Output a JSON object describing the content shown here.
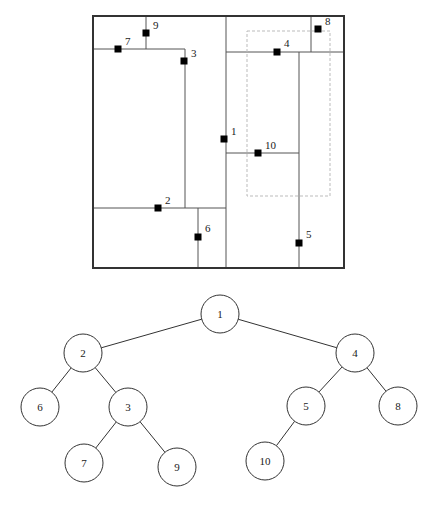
{
  "figure": {
    "type": "kd-tree-partition-with-binary-tree",
    "background_color": "#ffffff",
    "line_color": "#555555",
    "border_color": "#333333",
    "point_color": "#000000",
    "text_color": "#1a1a1a",
    "dashed_color": "#bbbbbb"
  },
  "partition_panel": {
    "name": "kd-tree-space-partition",
    "border": {
      "x": 93,
      "y": 16,
      "width": 251,
      "height": 252
    },
    "query_rectangle": {
      "x": 247,
      "y": 31,
      "width": 83,
      "height": 165,
      "style": "dashed"
    },
    "split_lines": [
      {
        "id": "split-1",
        "orientation": "vertical",
        "x": 226,
        "y1": 16,
        "y2": 268
      },
      {
        "id": "split-2",
        "orientation": "horizontal",
        "y": 208,
        "x1": 93,
        "x2": 226
      },
      {
        "id": "split-3",
        "orientation": "vertical",
        "x": 185,
        "y1": 49,
        "y2": 208
      },
      {
        "id": "split-4",
        "orientation": "horizontal",
        "y": 52,
        "x1": 226,
        "x2": 344
      },
      {
        "id": "split-5",
        "orientation": "vertical",
        "x": 299,
        "y1": 52,
        "y2": 268
      },
      {
        "id": "split-6",
        "orientation": "vertical",
        "x": 198,
        "y1": 208,
        "y2": 268
      },
      {
        "id": "split-7",
        "orientation": "horizontal",
        "y": 49,
        "x1": 93,
        "x2": 185
      },
      {
        "id": "split-8",
        "orientation": "vertical",
        "x": 311,
        "y1": 16,
        "y2": 52
      },
      {
        "id": "split-9",
        "orientation": "vertical",
        "x": 146,
        "y1": 16,
        "y2": 49
      },
      {
        "id": "split-10",
        "orientation": "horizontal",
        "y": 153,
        "x1": 226,
        "x2": 299
      }
    ],
    "points": [
      {
        "label": "1",
        "x": 224,
        "y": 139,
        "label_x": 231,
        "label_y": 135
      },
      {
        "label": "2",
        "x": 158,
        "y": 208,
        "label_x": 165,
        "label_y": 204
      },
      {
        "label": "3",
        "x": 184,
        "y": 61,
        "label_x": 191,
        "label_y": 57
      },
      {
        "label": "4",
        "x": 277,
        "y": 52,
        "label_x": 284,
        "label_y": 47
      },
      {
        "label": "5",
        "x": 299,
        "y": 243,
        "label_x": 306,
        "label_y": 238
      },
      {
        "label": "6",
        "x": 198,
        "y": 237,
        "label_x": 205,
        "label_y": 232
      },
      {
        "label": "7",
        "x": 118,
        "y": 49,
        "label_x": 125,
        "label_y": 45
      },
      {
        "label": "8",
        "x": 318,
        "y": 29,
        "label_x": 325,
        "label_y": 25
      },
      {
        "label": "9",
        "x": 146,
        "y": 33,
        "label_x": 153,
        "label_y": 29
      },
      {
        "label": "10",
        "x": 258,
        "y": 153,
        "label_x": 265,
        "label_y": 149
      }
    ]
  },
  "tree_panel": {
    "name": "binary-search-tree",
    "node_radius": 19,
    "nodes": [
      {
        "id": "n1",
        "label": "1",
        "cx": 220,
        "cy": 314
      },
      {
        "id": "n2",
        "label": "2",
        "cx": 83,
        "cy": 353
      },
      {
        "id": "n4",
        "label": "4",
        "cx": 355,
        "cy": 353
      },
      {
        "id": "n6",
        "label": "6",
        "cx": 40,
        "cy": 407
      },
      {
        "id": "n3",
        "label": "3",
        "cx": 128,
        "cy": 407
      },
      {
        "id": "n5",
        "label": "5",
        "cx": 306,
        "cy": 406
      },
      {
        "id": "n8",
        "label": "8",
        "cx": 398,
        "cy": 406
      },
      {
        "id": "n7",
        "label": "7",
        "cx": 84,
        "cy": 463
      },
      {
        "id": "n9",
        "label": "9",
        "cx": 177,
        "cy": 467
      },
      {
        "id": "n10",
        "label": "10",
        "cx": 265,
        "cy": 461
      }
    ],
    "edges": [
      {
        "from": "n1",
        "to": "n2"
      },
      {
        "from": "n1",
        "to": "n4"
      },
      {
        "from": "n2",
        "to": "n6"
      },
      {
        "from": "n2",
        "to": "n3"
      },
      {
        "from": "n3",
        "to": "n7"
      },
      {
        "from": "n3",
        "to": "n9"
      },
      {
        "from": "n4",
        "to": "n5"
      },
      {
        "from": "n4",
        "to": "n8"
      },
      {
        "from": "n5",
        "to": "n10"
      }
    ]
  }
}
